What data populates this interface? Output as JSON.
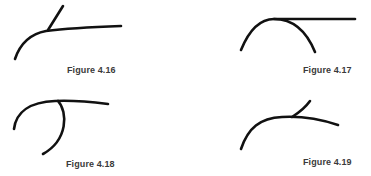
{
  "figures": [
    {
      "id": "fig-4-16",
      "caption": "Figure 4.16"
    },
    {
      "id": "fig-4-17",
      "caption": "Figure 4.17"
    },
    {
      "id": "fig-4-18",
      "caption": "Figure 4.18"
    },
    {
      "id": "fig-4-19",
      "caption": "Figure 4.19"
    }
  ],
  "style": {
    "stroke_color": "#111111",
    "caption_color": "#3a3a3a",
    "background": "#ffffff"
  }
}
